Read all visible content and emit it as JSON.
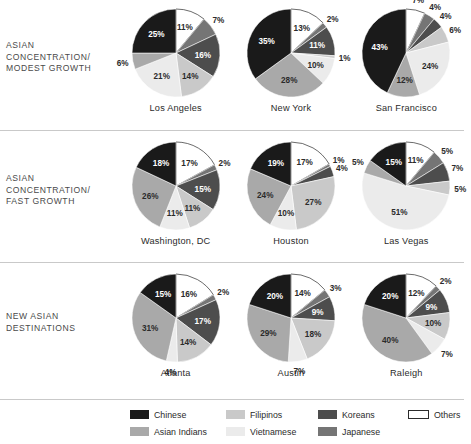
{
  "colors": {
    "chinese": "#1a1a1a",
    "asian_indians": "#a9a9a9",
    "filipinos": "#c9c9c9",
    "vietnamese": "#ebebeb",
    "koreans": "#4d4d4d",
    "japanese": "#757575",
    "others": "#ffffff",
    "others_border": "#2b2b2b",
    "divider": "#c9c9c9",
    "label_dark": "#4a4a4a"
  },
  "legend": {
    "items": [
      {
        "label": "Chinese",
        "key": "chinese",
        "swatch": "#1a1a1a",
        "outlined": false
      },
      {
        "label": "Filipinos",
        "key": "filipinos",
        "swatch": "#c9c9c9",
        "outlined": false
      },
      {
        "label": "Koreans",
        "key": "koreans",
        "swatch": "#4d4d4d",
        "outlined": false
      },
      {
        "label": "Others",
        "key": "others",
        "swatch": "#ffffff",
        "outlined": true
      },
      {
        "label": "Asian Indians",
        "key": "asian_indians",
        "swatch": "#a9a9a9",
        "outlined": false
      },
      {
        "label": "Vietnamese",
        "key": "vietnamese",
        "swatch": "#ebebeb",
        "outlined": false
      },
      {
        "label": "Japanese",
        "key": "japanese",
        "swatch": "#757575",
        "outlined": false
      }
    ]
  },
  "rows": [
    {
      "label": "ASIAN CONCENTRATION/ MODEST GROWTH",
      "label_lines": [
        "ASIAN",
        "CONCENTRATION/",
        "MODEST GROWTH"
      ]
    },
    {
      "label": "ASIAN CONCENTRATION/ FAST GROWTH",
      "label_lines": [
        "ASIAN",
        "CONCENTRATION/",
        "FAST GROWTH"
      ]
    },
    {
      "label": "NEW ASIAN DESTINATIONS",
      "label_lines": [
        "NEW ASIAN",
        "DESTINATIONS"
      ]
    }
  ],
  "chart_data": {
    "type": "pie",
    "value_suffix": "%",
    "categories": [
      "Others",
      "Japanese",
      "Koreans",
      "Filipinos",
      "Vietnamese",
      "Asian Indians",
      "Chinese"
    ],
    "category_colors": [
      "#ffffff",
      "#757575",
      "#4d4d4d",
      "#c9c9c9",
      "#ebebeb",
      "#a9a9a9",
      "#1a1a1a"
    ],
    "slice_order_note": "clockwise from 12 o'clock",
    "groups": [
      {
        "group": "ASIAN CONCENTRATION/ MODEST GROWTH",
        "charts": [
          {
            "name": "Los Angeles",
            "values": [
              11,
              7,
              16,
              14,
              21,
              6,
              25
            ],
            "labels": [
              "11%",
              "7%",
              "16%",
              "14%",
              "21%",
              "6%",
              "25%"
            ]
          },
          {
            "name": "New York",
            "values": [
              13,
              2,
              11,
              1,
              10,
              28,
              35
            ],
            "labels": [
              "13%",
              "2%",
              "11%",
              "1%",
              "10%",
              "28%",
              "35%"
            ]
          },
          {
            "name": "San Francisco",
            "values": [
              7,
              4,
              4,
              6,
              24,
              12,
              43
            ],
            "labels": [
              "7%",
              "4%",
              "4%",
              "6%",
              "24%",
              "12%",
              "43%"
            ]
          }
        ]
      },
      {
        "group": "ASIAN CONCENTRATION/ FAST GROWTH",
        "charts": [
          {
            "name": "Washington, DC",
            "values": [
              17,
              2,
              15,
              11,
              11,
              26,
              18
            ],
            "labels": [
              "17%",
              "2%",
              "15%",
              "11%",
              "11%",
              "26%",
              "18%"
            ]
          },
          {
            "name": "Houston",
            "values": [
              17,
              1,
              4,
              27,
              10,
              24,
              19
            ],
            "labels": [
              "17%",
              "1%",
              "4%",
              "27%",
              "10%",
              "24%",
              "19%"
            ]
          },
          {
            "name": "Las Vegas",
            "values": [
              11,
              5,
              7,
              5,
              51,
              5,
              15
            ],
            "labels": [
              "11%",
              "5%",
              "7%",
              "5%",
              "51%",
              "5%",
              "15%"
            ]
          }
        ]
      },
      {
        "group": "NEW ASIAN DESTINATIONS",
        "charts": [
          {
            "name": "Atlanta",
            "values": [
              16,
              2,
              17,
              14,
              4,
              31,
              15
            ],
            "labels": [
              "16%",
              "2%",
              "17%",
              "14%",
              "4%",
              "31%",
              "15%"
            ]
          },
          {
            "name": "Austin",
            "values": [
              14,
              3,
              9,
              18,
              7,
              29,
              20
            ],
            "labels": [
              "14%",
              "3%",
              "9%",
              "18%",
              "7%",
              "29%",
              "20%"
            ]
          },
          {
            "name": "Raleigh",
            "values": [
              12,
              2,
              9,
              10,
              7,
              40,
              20
            ],
            "labels": [
              "12%",
              "2%",
              "9%",
              "10%",
              "7%",
              "40%",
              "20%"
            ]
          }
        ]
      }
    ]
  }
}
